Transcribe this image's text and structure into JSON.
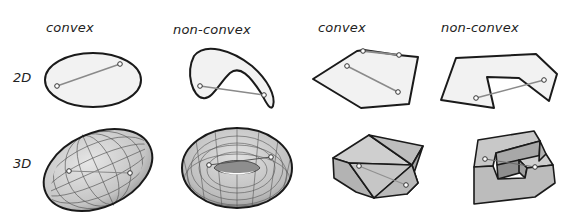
{
  "columns": [
    {
      "label": "convex",
      "x": 46,
      "y": 20
    },
    {
      "label": "non-convex",
      "x": 173,
      "y": 22
    },
    {
      "label": "convex",
      "x": 318,
      "y": 20
    },
    {
      "label": "non-convex",
      "x": 441,
      "y": 20
    }
  ],
  "rows": [
    {
      "label": "2D",
      "x": 13,
      "y": 70
    },
    {
      "label": "3D",
      "x": 13,
      "y": 156
    }
  ],
  "colors": {
    "fill_2d": "#f2f2f2",
    "stroke": "#1a1a1a",
    "segment": "#8a8a8a",
    "fill_3d_light": "#d0d0d0",
    "fill_3d_mid": "#b8b8b8",
    "fill_3d_dark": "#9a9a9a",
    "grid": "#555555"
  },
  "figures": [
    {
      "id": "2d-convex-ellipse",
      "row": "2D",
      "column": "convex",
      "segment": [
        [
          57,
          86
        ],
        [
          120,
          64
        ]
      ],
      "segment_inside": true
    },
    {
      "id": "2d-nonconvex-crescent",
      "row": "2D",
      "column": "non-convex",
      "segment": [
        [
          200,
          86
        ],
        [
          264,
          95
        ]
      ],
      "segment_inside": false
    },
    {
      "id": "2d-convex-polygon",
      "row": "2D",
      "column": "convex",
      "segments": [
        [
          [
            363,
            51
          ],
          [
            399,
            55
          ]
        ],
        [
          [
            347,
            66
          ],
          [
            398,
            92
          ]
        ]
      ],
      "segment_inside": true
    },
    {
      "id": "2d-nonconvex-polygon",
      "row": "2D",
      "column": "non-convex",
      "segment": [
        [
          476,
          98
        ],
        [
          544,
          80
        ]
      ],
      "segment_inside": false
    },
    {
      "id": "3d-convex-ellipsoid",
      "row": "3D",
      "column": "convex",
      "segment": [
        [
          69,
          171
        ],
        [
          130,
          173
        ]
      ],
      "segment_inside": true
    },
    {
      "id": "3d-nonconvex-torus",
      "row": "3D",
      "column": "non-convex",
      "segment": [
        [
          209,
          165
        ],
        [
          271,
          157
        ]
      ],
      "segment_inside": false
    },
    {
      "id": "3d-convex-polyhedron",
      "row": "3D",
      "column": "convex",
      "segment": [
        [
          359,
          166
        ],
        [
          406,
          185
        ]
      ],
      "segment_inside": true
    },
    {
      "id": "3d-nonconvex-block",
      "row": "3D",
      "column": "non-convex",
      "segment": [
        [
          485,
          159
        ],
        [
          535,
          167
        ]
      ],
      "segment_inside": false
    }
  ]
}
